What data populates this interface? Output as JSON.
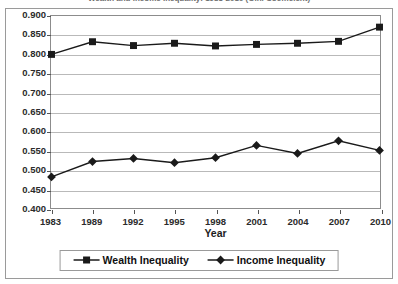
{
  "chart_data": {
    "type": "line",
    "title": "Wealth and Income Inequality: 1983-2010 (Gini Coefficient)",
    "xlabel": "Year",
    "ylabel": "",
    "categories": [
      "1983",
      "1989",
      "1992",
      "1995",
      "1998",
      "2001",
      "2004",
      "2007",
      "2010"
    ],
    "ylim": [
      0.4,
      0.9
    ],
    "ytick_step": 0.05,
    "ytick_labels": [
      "0.900",
      "0.850",
      "0.800",
      "0.750",
      "0.700",
      "0.650",
      "0.600",
      "0.550",
      "0.500",
      "0.450",
      "0.400"
    ],
    "ytick_values": [
      0.9,
      0.85,
      0.8,
      0.75,
      0.7,
      0.65,
      0.6,
      0.55,
      0.5,
      0.45,
      0.4
    ],
    "grid": true,
    "legend_position": "bottom",
    "series": [
      {
        "name": "Wealth Inequality",
        "marker": "square",
        "color": "#1a1a1a",
        "values": [
          0.8,
          0.833,
          0.823,
          0.829,
          0.822,
          0.826,
          0.829,
          0.834,
          0.871
        ]
      },
      {
        "name": "Income Inequality",
        "marker": "diamond",
        "color": "#1a1a1a",
        "values": [
          0.481,
          0.521,
          0.529,
          0.518,
          0.531,
          0.563,
          0.542,
          0.575,
          0.55
        ]
      }
    ]
  },
  "colors": {
    "series_line": "#1a1a1a",
    "grid": "#b9b9b9",
    "axis": "#8c8c8c",
    "frame": "#9a9a9a",
    "text": "#1d1d1d"
  }
}
